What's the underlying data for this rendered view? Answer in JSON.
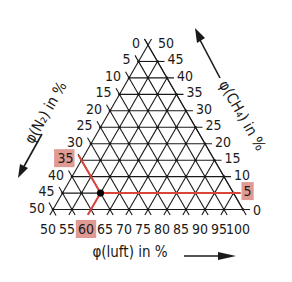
{
  "diagram": {
    "type": "ternary",
    "axes": {
      "left": {
        "title": "φ(N₂) in %",
        "ticks": [
          "0",
          "5",
          "10",
          "15",
          "20",
          "25",
          "30",
          "35",
          "40",
          "45",
          "50"
        ]
      },
      "right": {
        "title": "φ(CH₄) in %",
        "ticks": [
          "50",
          "45",
          "40",
          "35",
          "30",
          "25",
          "20",
          "15",
          "10",
          "5",
          "0"
        ]
      },
      "bottom": {
        "title": "φ(luft) in %",
        "ticks": [
          "50",
          "55",
          "60",
          "65",
          "70",
          "75",
          "80",
          "85",
          "90",
          "95",
          "100"
        ]
      }
    },
    "highlighted_point": {
      "N2": 35,
      "CH4": 5,
      "luft": 60
    },
    "highlighted_labels": {
      "left": "35",
      "right": "5",
      "bottom": "60"
    },
    "colors": {
      "grid": "#1a1a1a",
      "highlight_line": "#d9453a",
      "highlight_box": "#e09a94",
      "point": "#000000"
    }
  }
}
